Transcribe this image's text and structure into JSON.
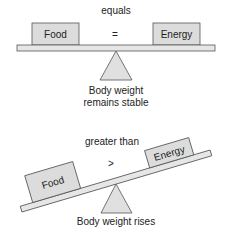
{
  "colors": {
    "box_fill": "#dcdcdc",
    "box_stroke": "#555555",
    "beam_fill": "#e6e6e6",
    "fulcrum_fill": "#e0e0e0",
    "text": "#222222"
  },
  "top_scale": {
    "relation_label": "equals",
    "operator": "=",
    "left_box": "Food",
    "right_box": "Energy",
    "caption_line1": "Body weight",
    "caption_line2": "remains stable"
  },
  "bottom_scale": {
    "relation_label": "greater than",
    "operator": ">",
    "left_box": "Food",
    "right_box": "Energy",
    "caption": "Body weight rises"
  }
}
